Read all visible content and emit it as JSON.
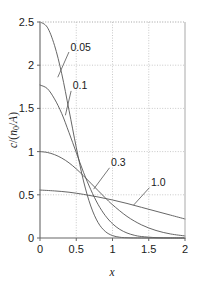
{
  "chart_data": {
    "type": "line",
    "title": "",
    "subtitle": "",
    "xlabel": "x",
    "ylabel": "c/(n0/A)",
    "ylabel_parts": {
      "numerator": "c",
      "denominator_n": "n",
      "denominator_sub": "0",
      "denominator_a": "A"
    },
    "xlim": [
      0,
      2
    ],
    "ylim": [
      0,
      2.5
    ],
    "xticks": [
      "0",
      "0.5",
      "1",
      "1.5",
      "2"
    ],
    "xtick_values": [
      0,
      0.5,
      1,
      1.5,
      2
    ],
    "yticks": [
      "0",
      "0.5",
      "1",
      "1.5",
      "2",
      "2.5"
    ],
    "ytick_values": [
      0,
      0.5,
      1,
      1.5,
      2,
      2.5
    ],
    "grid": true,
    "grid_style": "dotted",
    "grid_color": "#bbbbbb",
    "legend_position": "inline-annotations",
    "line_color": "#555555",
    "axis_color": "#666666",
    "series": [
      {
        "name": "0.05",
        "label": "0.05",
        "x": [
          0,
          0.1,
          0.2,
          0.3,
          0.4,
          0.5,
          0.6,
          0.7,
          0.8,
          0.9,
          1.0,
          1.1,
          1.2,
          1.4,
          1.6,
          1.8,
          2.0
        ],
        "values": [
          2.5,
          2.44,
          2.23,
          1.9,
          1.48,
          1.05,
          0.66,
          0.37,
          0.18,
          0.076,
          0.028,
          0.009,
          0.0025,
          0.0001,
          0,
          0,
          0
        ]
      },
      {
        "name": "0.1",
        "label": "0.1",
        "x": [
          0,
          0.1,
          0.2,
          0.3,
          0.4,
          0.5,
          0.6,
          0.7,
          0.8,
          0.9,
          1.0,
          1.1,
          1.2,
          1.3,
          1.4,
          1.6,
          1.8,
          2.0
        ],
        "values": [
          1.77,
          1.73,
          1.61,
          1.44,
          1.22,
          0.99,
          0.76,
          0.56,
          0.39,
          0.26,
          0.165,
          0.1,
          0.058,
          0.032,
          0.017,
          0.004,
          0.001,
          0.0002
        ]
      },
      {
        "name": "0.3",
        "label": "0.3",
        "x": [
          0,
          0.1,
          0.2,
          0.3,
          0.4,
          0.5,
          0.6,
          0.7,
          0.8,
          0.9,
          1.0,
          1.2,
          1.4,
          1.6,
          1.8,
          2.0
        ],
        "values": [
          1.0,
          0.99,
          0.965,
          0.925,
          0.87,
          0.8,
          0.72,
          0.635,
          0.55,
          0.465,
          0.385,
          0.25,
          0.152,
          0.087,
          0.047,
          0.024
        ]
      },
      {
        "name": "1.0",
        "label": "1.0",
        "x": [
          0,
          0.2,
          0.4,
          0.6,
          0.8,
          1.0,
          1.2,
          1.4,
          1.6,
          1.8,
          2.0
        ],
        "values": [
          0.555,
          0.545,
          0.53,
          0.505,
          0.475,
          0.44,
          0.4,
          0.355,
          0.31,
          0.265,
          0.22
        ]
      }
    ],
    "annotations": [
      {
        "label": "0.05",
        "text_x": 0.42,
        "text_y": 2.17,
        "leader_to_x": 0.245,
        "leader_to_y": 1.86
      },
      {
        "label": "0.1",
        "text_x": 0.45,
        "text_y": 1.72,
        "leader_to_x": 0.35,
        "leader_to_y": 1.42
      },
      {
        "label": "0.3",
        "text_x": 0.98,
        "text_y": 0.83,
        "leader_to_x": 0.74,
        "leader_to_y": 0.565
      },
      {
        "label": "1.0",
        "text_x": 1.53,
        "text_y": 0.6,
        "leader_to_x": 1.29,
        "leader_to_y": 0.38
      }
    ]
  }
}
